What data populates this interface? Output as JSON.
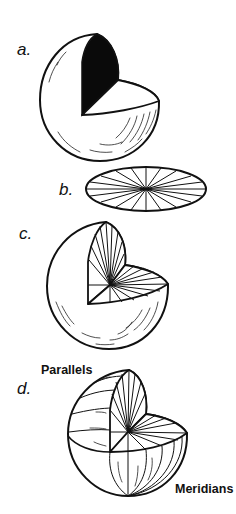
{
  "figure": {
    "background": "#ffffff",
    "ink": "#111111",
    "panels": [
      {
        "id": "a",
        "label": "a.",
        "description": "sphere with quarter wedge removed; vertical cut face solid black"
      },
      {
        "id": "b",
        "label": "b.",
        "description": "flat disk (ellipse) divided by radial lines from center"
      },
      {
        "id": "c",
        "label": "c.",
        "description": "sphere with quarter wedge removed; cut faces filled with radial lines"
      },
      {
        "id": "d",
        "label": "d.",
        "description": "sphere with parallels and meridians drawn, quarter wedge removed"
      }
    ],
    "annotations": {
      "parallels": "Parallels",
      "meridians": "Meridians"
    }
  }
}
